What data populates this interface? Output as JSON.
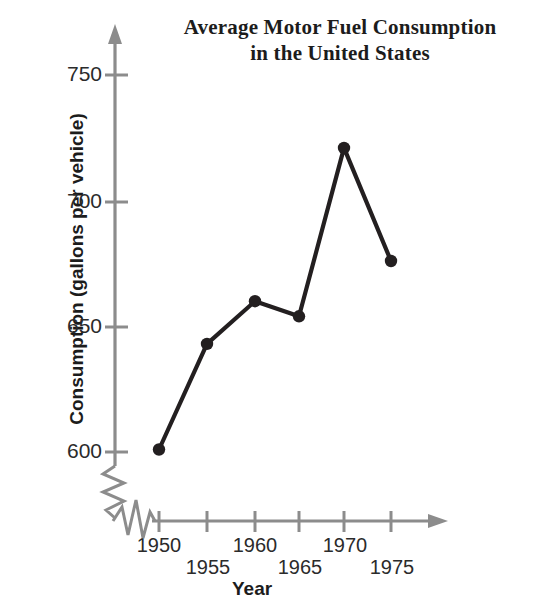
{
  "chart_data": {
    "type": "line",
    "title": "Average Motor Fuel Consumption in the United States",
    "title_line1": "Average Motor Fuel Consumption",
    "title_line2": "in the United States",
    "xlabel": "Year",
    "ylabel": "Consumption (gallons per vehicle)",
    "x": [
      1950,
      1955,
      1960,
      1965,
      1970,
      1975
    ],
    "values": [
      601,
      643,
      660,
      654,
      721,
      676
    ],
    "xtick_labels": [
      "1950",
      "1955",
      "1960",
      "1965",
      "1970",
      "1975"
    ],
    "ytick_labels": [
      "750",
      "700",
      "650",
      "600"
    ],
    "ytick_values": [
      750,
      700,
      650,
      600
    ],
    "ylim": [
      595,
      765
    ],
    "xlim": [
      1950,
      1977
    ],
    "grid": false,
    "legend": false,
    "axis_break_y": true,
    "axis_break_x": true,
    "marker": "filled-circle",
    "line_color": "#231f20",
    "axis_color": "#8c8c8c",
    "text_color": "#1c1c1c",
    "background": "#ffffff"
  },
  "annotations": {
    "y_axis_break_symbol": "zigzag-break",
    "x_axis_break_symbol": "zigzag-break",
    "y_axis_arrow": "arrow-up",
    "x_axis_arrow": "arrow-right"
  }
}
